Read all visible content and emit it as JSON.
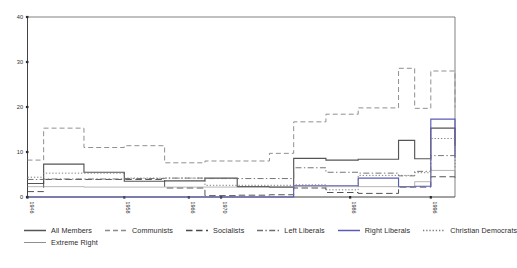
{
  "chart_data": {
    "type": "line",
    "subtype": "step",
    "title": "",
    "xlabel": "",
    "ylabel": "",
    "ylim": [
      0,
      40
    ],
    "yticks": [
      0,
      10,
      20,
      30,
      40
    ],
    "ytick_labels": [
      "0",
      "10",
      "20",
      "30",
      "40"
    ],
    "xlim": [
      1946,
      1999
    ],
    "xticks": [
      1946,
      1958,
      1966,
      1970,
      1986,
      1996
    ],
    "xtick_labels": [
      "1946",
      "1958",
      "1966",
      "1970",
      "1986",
      "1996"
    ],
    "grid": false,
    "legend_position": "bottom",
    "x_breaks": [
      1946,
      1948,
      1953,
      1958,
      1963,
      1968,
      1972,
      1976,
      1979,
      1983,
      1987,
      1992,
      1994,
      1996,
      1999
    ],
    "series": [
      {
        "name": "All Members",
        "style": "solid",
        "color": "#555555",
        "values": [
          3.0,
          7.3,
          5.5,
          3.5,
          3.6,
          4.2,
          2.3,
          2.2,
          8.6,
          8.2,
          8.4,
          12.6,
          8.5,
          15.3,
          11.4
        ]
      },
      {
        "name": "Communists",
        "style": "dashed",
        "color": "#8a8a8a",
        "values": [
          8.2,
          15.3,
          11.0,
          11.4,
          7.6,
          8.0,
          8.0,
          9.7,
          16.7,
          18.4,
          19.8,
          28.6,
          19.7,
          28.0,
          19.9
        ]
      },
      {
        "name": "Socialists",
        "style": "longdash",
        "color": "#4a4a4a",
        "values": [
          1.2,
          3.9,
          3.9,
          3.9,
          2.0,
          0.3,
          0.4,
          0.5,
          2.0,
          1.0,
          0.8,
          2.2,
          2.2,
          4.5,
          4.3
        ]
      },
      {
        "name": "Left Liberals",
        "style": "dashdot",
        "color": "#6e6e6e",
        "values": [
          3.9,
          4.0,
          4.0,
          4.1,
          4.2,
          4.1,
          4.1,
          4.1,
          6.5,
          5.5,
          5.3,
          4.7,
          5.7,
          9.2,
          9.2
        ]
      },
      {
        "name": "Right Liberals",
        "style": "solid",
        "color": "#5b5bb5",
        "values": [
          0.0,
          0.0,
          0.0,
          0.0,
          0.0,
          0.0,
          0.0,
          0.0,
          2.5,
          2.5,
          4.2,
          2.3,
          2.4,
          17.3,
          8.8
        ]
      },
      {
        "name": "Christian Democrats",
        "style": "dotted",
        "color": "#7a7a7a",
        "values": [
          4.4,
          5.3,
          5.3,
          4.2,
          4.2,
          2.6,
          2.6,
          2.6,
          2.7,
          1.6,
          4.8,
          4.8,
          5.4,
          13.0,
          6.2
        ]
      },
      {
        "name": "Extreme Right",
        "style": "solid-thin",
        "color": "#8f8f8f",
        "values": [
          2.3,
          2.3,
          2.2,
          2.2,
          2.2,
          2.2,
          2.2,
          2.3,
          2.3,
          2.3,
          2.3,
          2.3,
          3.4,
          5.9,
          4.4
        ]
      }
    ]
  },
  "legend": {
    "rows": [
      [
        {
          "label": "All Members",
          "key": "all-members"
        },
        {
          "label": "Communists",
          "key": "communists"
        },
        {
          "label": "Socialists",
          "key": "socialists"
        },
        {
          "label": "Left Liberals",
          "key": "left-liberals"
        },
        {
          "label": "Right Liberals",
          "key": "right-liberals"
        },
        {
          "label": "Christian Democrats",
          "key": "christian-democrats"
        }
      ],
      [
        {
          "label": "Extreme Right",
          "key": "extreme-right"
        }
      ]
    ]
  },
  "colors": {
    "axis": "#2e2e2e",
    "background": "#ffffff",
    "right_liberals_accent": "#5b5bb5"
  }
}
